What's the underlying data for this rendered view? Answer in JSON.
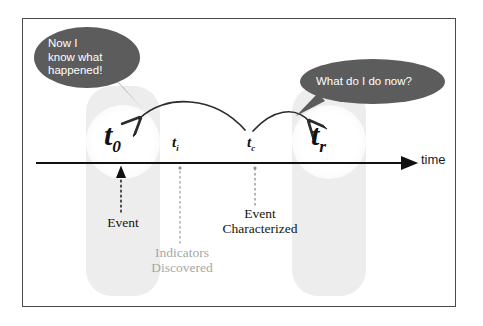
{
  "figure": {
    "border_color": "#4a4a4a",
    "band_color": "#ededed",
    "bubble_color": "#5c5c5c",
    "axis_color": "#111111",
    "gray_text_color": "#a6a6a6"
  },
  "bubbles": [
    {
      "id": "left",
      "text": "Now I\nknow what\nhappened!"
    },
    {
      "id": "right",
      "text": "What do I do now?"
    }
  ],
  "axis": {
    "label": "time",
    "direction": "right"
  },
  "markers": [
    {
      "id": "t0",
      "symbol": "t",
      "subscript": "0",
      "size": "big",
      "caption": "Event",
      "caption_color": "dark"
    },
    {
      "id": "ti",
      "symbol": "t",
      "subscript": "i",
      "size": "small",
      "caption": "Indicators\nDiscovered",
      "caption_color": "gray"
    },
    {
      "id": "tc",
      "symbol": "t",
      "subscript": "c",
      "size": "small",
      "caption": "Event\nCharacterized",
      "caption_color": "dark"
    },
    {
      "id": "tr",
      "symbol": "t",
      "subscript": "r",
      "size": "big",
      "caption": "",
      "caption_color": "dark"
    }
  ],
  "captions": {
    "event": "Event",
    "indicators": "Indicators\nDiscovered",
    "characterized": "Event\nCharacterized"
  },
  "arcs": [
    {
      "id": "arc-left",
      "from": "t_c",
      "to": "t_0",
      "direction": "leftward"
    },
    {
      "id": "arc-right",
      "from": "t_c",
      "to": "t_r",
      "direction": "rightward"
    }
  ]
}
